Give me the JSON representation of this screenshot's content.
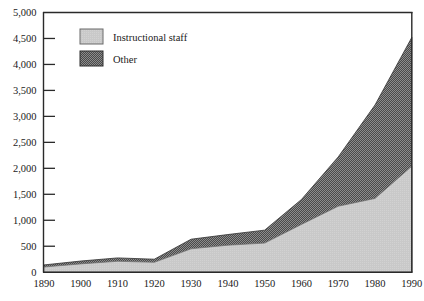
{
  "chart_data": {
    "type": "area",
    "title": "",
    "subtitle": "",
    "xlabel": "",
    "ylabel": "",
    "stacked": true,
    "grid": false,
    "legend_position": "top-left",
    "x": [
      1890,
      1900,
      1910,
      1920,
      1930,
      1940,
      1950,
      1960,
      1970,
      1980,
      1990
    ],
    "categories": [
      "1890",
      "1900",
      "1910",
      "1920",
      "1930",
      "1940",
      "1950",
      "1960",
      "1970",
      "1980",
      "1990"
    ],
    "xlim": [
      1890,
      1990
    ],
    "ylim": [
      0,
      5000
    ],
    "ytick_values": [
      0,
      500,
      1000,
      1500,
      2000,
      2500,
      3000,
      3500,
      4000,
      4500,
      5000
    ],
    "ytick_labels": [
      "0",
      "500",
      "1,000",
      "1,500",
      "2,000",
      "2,500",
      "3,000",
      "3,500",
      "4,000",
      "4,500",
      "5,000"
    ],
    "series": [
      {
        "name": "Instructional staff",
        "color": "#c9c9c9",
        "pattern": "solid-light",
        "values": [
          100,
          160,
          210,
          190,
          450,
          520,
          560,
          920,
          1270,
          1420,
          2040
        ]
      },
      {
        "name": "Other",
        "color": "#565656",
        "pattern": "checker-dark",
        "values": [
          40,
          55,
          65,
          60,
          185,
          205,
          250,
          480,
          950,
          1800,
          2480
        ]
      }
    ],
    "totals": [
      140,
      215,
      275,
      250,
      635,
      725,
      810,
      1400,
      2220,
      3220,
      4520
    ]
  },
  "legend": {
    "items": [
      {
        "label": "Instructional staff",
        "swatch": "light-gray"
      },
      {
        "label": "Other",
        "swatch": "dark-checker"
      }
    ]
  },
  "axes": {
    "y_tick_labels": [
      "5,000",
      "4,500",
      "4,000",
      "3,500",
      "3,000",
      "2,500",
      "2,000",
      "1,500",
      "1,000",
      "500",
      "0"
    ],
    "x_tick_labels": [
      "1890",
      "1900",
      "1910",
      "1920",
      "1930",
      "1940",
      "1950",
      "1960",
      "1970",
      "1980",
      "1990"
    ]
  },
  "colors": {
    "instructional_staff": "#c9c9c9",
    "other": "#565656",
    "axis": "#2a2a2a",
    "background": "#ffffff",
    "text": "#1a1a1a"
  }
}
